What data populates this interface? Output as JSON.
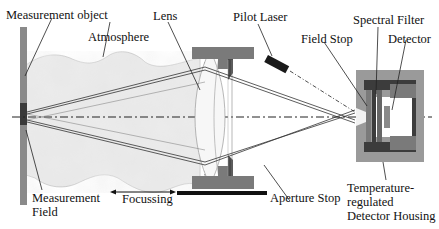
{
  "labels": {
    "measurement_object": "Measurement object",
    "atmosphere": "Atmosphere",
    "lens": "Lens",
    "pilot_laser": "Pilot Laser",
    "spectral_filter": "Spectral Filter",
    "field_stop": "Field Stop",
    "detector": "Detector",
    "measurement_field_1": "Measurement",
    "measurement_field_2": "Field",
    "focussing": "Focussing",
    "aperture_stop": "Aperture Stop",
    "housing_1": "Temperature-",
    "housing_2": "regulated",
    "housing_3": "Detector Housing"
  },
  "colors": {
    "object_bar": "#8a8a8a",
    "object_field": "#3a3a3a",
    "atmosphere": "#e4e4e4",
    "mount": "#7a7a7a",
    "housing_outer": "#9a9a9a",
    "housing_inner": "#3c3c3c",
    "rays": "#333333"
  }
}
